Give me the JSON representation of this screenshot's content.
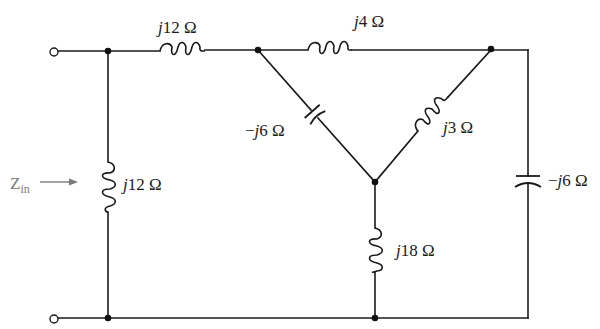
{
  "diagram": {
    "type": "ac-circuit-schematic",
    "input_label": {
      "main": "Z",
      "sub": "in"
    },
    "components": [
      {
        "id": "L_shunt_left",
        "kind": "inductor",
        "prefix": "j",
        "value": "12",
        "unit": "Ω",
        "text": "j12 Ω",
        "position": "left vertical shunt"
      },
      {
        "id": "L_series_top",
        "kind": "inductor",
        "prefix": "j",
        "value": "12",
        "unit": "Ω",
        "text": "j12 Ω",
        "position": "top series"
      },
      {
        "id": "L_delta_top",
        "kind": "inductor",
        "prefix": "j",
        "value": "4",
        "unit": "Ω",
        "text": "j4 Ω",
        "position": "top between delta nodes"
      },
      {
        "id": "C_diag_left",
        "kind": "capacitor",
        "prefix": "−j",
        "value": "6",
        "unit": "Ω",
        "text": "−j6 Ω",
        "position": "left diagonal to center node"
      },
      {
        "id": "L_diag_right",
        "kind": "inductor",
        "prefix": "j",
        "value": "3",
        "unit": "Ω",
        "text": "j3 Ω",
        "position": "right diagonal to center node"
      },
      {
        "id": "L_center_down",
        "kind": "inductor",
        "prefix": "j",
        "value": "18",
        "unit": "Ω",
        "text": "j18 Ω",
        "position": "center vertical to bottom rail"
      },
      {
        "id": "C_right",
        "kind": "capacitor",
        "prefix": "−j",
        "value": "6",
        "unit": "Ω",
        "text": "−j6 Ω",
        "position": "right vertical"
      }
    ]
  },
  "labels": {
    "L_shunt_left": {
      "j": "j",
      "rest": "12 Ω"
    },
    "L_series_top": {
      "j": "j",
      "rest": "12 Ω"
    },
    "L_delta_top": {
      "j": "j",
      "rest": "4 Ω"
    },
    "C_diag_left": {
      "neg": "−",
      "j": "j",
      "rest": "6 Ω"
    },
    "L_diag_right": {
      "j": "j",
      "rest": "3 Ω"
    },
    "L_center_down": {
      "j": "j",
      "rest": "18 Ω"
    },
    "C_right": {
      "neg": "−",
      "j": "j",
      "rest": "6 Ω"
    }
  },
  "colors": {
    "wire": "#1a1a1a",
    "zin_label": "#7a7a7a",
    "background": "#ffffff"
  }
}
